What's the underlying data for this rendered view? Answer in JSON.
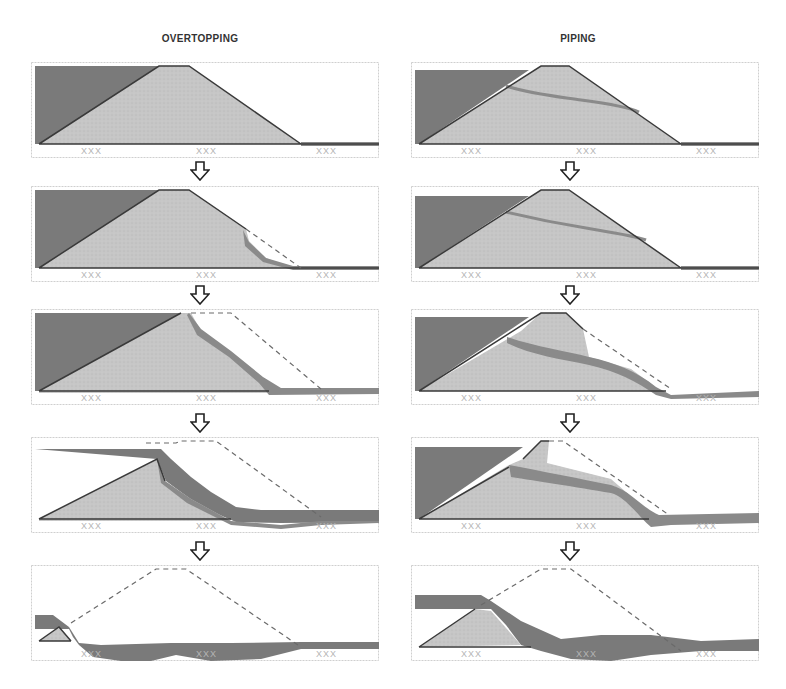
{
  "columns": [
    {
      "title": "OVERTOPPING",
      "x": 31,
      "title_center_x": 200
    },
    {
      "title": "PIPING",
      "x": 411,
      "title_center_x": 578
    }
  ],
  "row_tops": [
    62,
    186,
    309,
    437,
    565
  ],
  "arrows": {
    "left_x": 190,
    "right_x": 560,
    "tops": [
      161,
      285,
      413,
      541
    ]
  },
  "colors": {
    "frame": "#cfcfcf",
    "water": "#7a7a7a",
    "embankment": "#c6c6c6",
    "erosion": "#8a8a8a",
    "outline": "#3a3a3a",
    "dashed": "#6a6a6a",
    "foundation_marks": "#b5b5b5"
  },
  "legend_marks": "XXX",
  "stages": {
    "overtopping": [
      {
        "step": 1,
        "label": "intact-embankment",
        "water": "M4,4 L150,4 L8,82 L4,82 Z",
        "embankment": "M8,82 L128,4 L158,4 L270,82 Z",
        "erosion": "M270,80 L348,80 L348,84 L270,84 Z",
        "dashed": "",
        "outline": "M8,82 L128,4 L158,4 L270,82 M8,82 L348,82"
      },
      {
        "step": 2,
        "label": "toe-erosion-begins",
        "water": "M4,4 L150,4 L8,82 L4,82 Z",
        "embankment": "M8,82 L128,4 L158,4 L215,43 L218,55 L235,72 L262,82 Z",
        "erosion": "M212,44 L218,56 L235,72 L262,80 L348,80 L348,84 L262,84 L232,76 L214,60 Z",
        "dashed": "M215,43 L270,82",
        "outline": "M8,82 L128,4 L158,4 L215,43 M8,82 L348,82"
      },
      {
        "step": 3,
        "label": "downstream-slope-eroded",
        "water": "M4,4 L150,4 L8,82 L4,82 Z",
        "embankment": "M8,82 L150,4 L160,4 L170,22 L200,45 L230,72 L238,84 L8,84 Z",
        "erosion": "M158,4 L170,20 L200,42 L232,68 L250,79 L348,79 L348,85 L238,86 L228,74 L198,48 L166,26 L156,6 Z",
        "dashed": "M160,4 L200,4 L290,80",
        "outline": "M8,82 L150,4 M8,82 L238,82"
      },
      {
        "step": 4,
        "label": "crest-breached",
        "water": "M4,12 L130,12 L140,22 L160,40 L180,55 L205,70 L230,73 L348,73 L348,85 L250,86 L205,85 L170,70 L135,44 L126,22 Z",
        "embankment": "M8,82 L126,22 L134,44 L160,62 L200,84 L8,84 Z",
        "erosion": "M126,22 L134,44 L160,62 L200,84 L250,88 L290,84 L348,84 L348,86 L290,88 L250,92 L200,88 L156,66 L130,46 Z",
        "dashed": "M115,6 L145,6 L150,4 L185,4 L290,80",
        "outline": "M8,82 L126,22 L134,44 M8,82 L200,82"
      },
      {
        "step": 5,
        "label": "embankment-washed-away",
        "water": "M4,50 L22,50 L38,62 L48,78 L70,80 L140,78 L200,78 L270,77 L348,77 L348,84 L270,84 L230,94 L180,96 L145,90 L120,96 L90,96 L62,92 L48,80 L42,72 L38,64 L4,64 Z",
        "embankment": "M8,76 L28,62 L40,76 Z",
        "erosion": "",
        "dashed": "M40,58 L125,4 L155,4 L270,82",
        "outline": "M8,76 L28,62 L40,76 M8,76 L40,76"
      }
    ],
    "piping": [
      {
        "step": 1,
        "label": "intact-embankment",
        "water": "M4,8 L118,8 L8,82 L4,82 Z",
        "embankment": "M8,82 L130,4 L158,4 L270,82 Z",
        "erosion": "M270,80 L348,80 L348,84 L270,84 Z",
        "pipe": "M95,24 C120,32 150,35 170,38 C200,42 220,46 228,50",
        "dashed": "",
        "outline": "M8,82 L130,4 L158,4 L270,82 M8,82 L348,82"
      },
      {
        "step": 2,
        "label": "seepage-pipe-forms",
        "water": "M4,10 L118,10 L8,82 L4,82 Z",
        "embankment": "M8,82 L130,4 L158,4 L270,82 Z",
        "erosion": "M270,80 L348,80 L348,84 L270,84 Z",
        "pipe": "M95,26 C120,32 150,38 175,42 C205,47 225,50 235,54",
        "dashed": "",
        "outline": "M8,82 L130,4 L158,4 L270,82 M8,82 L348,82"
      },
      {
        "step": 3,
        "label": "pipe-enlarges-downstream-collapse",
        "water": "M4,8 L118,8 L8,82 L4,82 Z",
        "embankment": "M8,82 L110,22 L130,4 L155,4 L172,20 L178,48 L220,60 L250,82 Z",
        "erosion": "M96,28 C125,38 155,42 178,48 C205,54 225,62 245,78 L260,86 L348,82 L348,88 L260,90 L245,86 C225,72 205,62 178,56 C150,50 120,46 96,34 Z",
        "dashed": "M172,20 L260,80",
        "outline": "M8,82 L130,4 L155,4 L172,20 M8,82 L255,82"
      },
      {
        "step": 4,
        "label": "pipe-widens-breach",
        "water": "M4,10 L112,10 L8,82 L4,82 Z",
        "embankment": "M8,82 L98,28 L112,22 L130,4 L138,4 L136,26 L200,42 L230,68 L238,82 Z",
        "erosion": "M98,28 C130,34 170,42 200,48 C220,54 230,70 248,78 L348,76 L348,86 L260,88 L240,90 C228,80 215,60 200,56 C165,50 125,44 100,40 Z",
        "dashed": "M138,4 L152,4 L258,78",
        "outline": "M8,82 L98,30 M112,22 L130,4 L138,4 M8,82 L238,82"
      },
      {
        "step": 5,
        "label": "embankment-washed-away",
        "water": "M4,30 L70,30 L80,36 L110,56 L150,74 L190,70 L240,70 L290,76 L348,74 L348,86 L290,86 L240,90 L200,96 L160,94 L130,86 L110,80 L95,60 L80,44 L4,44 Z",
        "embankment": "M8,82 L64,44 L80,46 L110,80 Z",
        "erosion": "",
        "dashed": "M70,40 L130,4 L160,4 L270,86",
        "outline": "M8,82 L64,44 M8,82 L120,82"
      }
    ]
  }
}
